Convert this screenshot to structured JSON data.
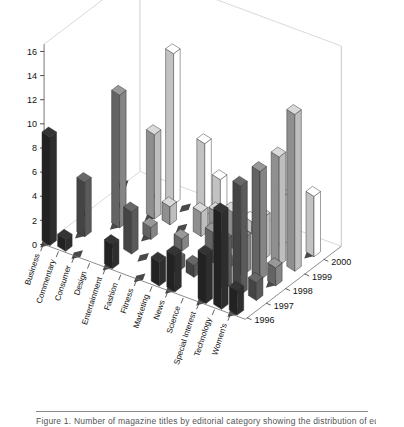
{
  "figure": {
    "caption": "Figure 1. Number of magazine titles by editorial category showing the distribution of edito",
    "title": ""
  },
  "chart_data": {
    "type": "bar",
    "subtype": "3d-grouped-bar",
    "title": "",
    "xlabel": "",
    "ylabel": "",
    "zlabel": "",
    "grid": false,
    "legend": "none",
    "ylim": [
      0,
      16
    ],
    "yticks": [
      0,
      2,
      4,
      6,
      8,
      10,
      12,
      14,
      16
    ],
    "ytick_labels": [
      "0",
      "2",
      "4",
      "6",
      "8",
      "10",
      "12",
      "14",
      "16"
    ],
    "categories": [
      "Business",
      "Commentary",
      "Consumer",
      "Design",
      "Entertainment",
      "Fashion",
      "Fitness",
      "Marketing",
      "News",
      "Science",
      "Special Interest",
      "Technology",
      "Women's"
    ],
    "depth_categories": [
      "1996",
      "1997",
      "1998",
      "1999",
      "2000"
    ],
    "series": [
      {
        "name": "1996",
        "color": "#2b2b2b",
        "values": [
          9,
          1,
          0,
          0,
          2,
          0,
          0,
          2,
          3,
          0,
          4,
          8,
          2
        ]
      },
      {
        "name": "1997",
        "color": "#555555",
        "values": [
          0,
          4.5,
          0,
          0,
          3.5,
          0,
          0,
          1,
          1,
          0,
          4,
          9,
          1.5
        ]
      },
      {
        "name": "1998",
        "color": "#7d7d7d",
        "values": [
          0,
          0,
          11,
          0,
          1,
          0,
          1,
          0,
          2.5,
          0.5,
          3,
          9,
          1.5
        ]
      },
      {
        "name": "1999",
        "color": "#b3b3b3",
        "values": [
          0,
          0,
          0,
          7,
          1.5,
          0,
          2,
          2.5,
          3,
          0,
          3.5,
          9,
          13
        ]
      },
      {
        "name": "2000",
        "color": "#f2f2f2",
        "values": [
          0,
          0,
          0,
          12.5,
          0,
          6,
          3.5,
          0,
          1,
          0,
          4,
          0,
          5
        ]
      }
    ]
  }
}
